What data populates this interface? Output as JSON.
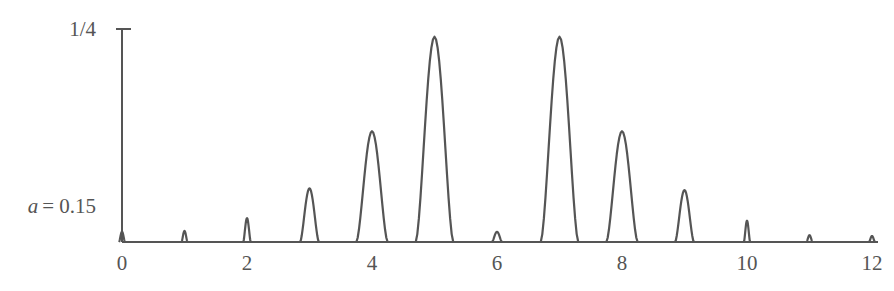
{
  "chart_data": {
    "type": "line",
    "title": "",
    "xlabel": "",
    "ylabel": "",
    "annotation": "a = 0.15",
    "annotation_var": "a",
    "annotation_rest": "= 0.15",
    "y_top_label": "1/4",
    "xlim": [
      0,
      12
    ],
    "ylim": [
      0,
      0.25
    ],
    "grid": false,
    "legend": null,
    "x_ticks": [
      0,
      2,
      4,
      6,
      8,
      10,
      12
    ],
    "x_tick_labels": [
      "0",
      "2",
      "4",
      "6",
      "8",
      "10",
      "12"
    ],
    "y_ticks": [
      0.25
    ],
    "y_tick_labels": [
      "1/4"
    ],
    "series": [
      {
        "name": "peaks",
        "style": "narrow peaks at integer positions",
        "x": [
          0,
          1,
          2,
          3,
          4,
          5,
          6,
          7,
          8,
          9,
          10,
          11,
          12
        ],
        "values": [
          0.012,
          0.013,
          0.028,
          0.063,
          0.13,
          0.241,
          0.012,
          0.241,
          0.13,
          0.061,
          0.025,
          0.008,
          0.007
        ],
        "half_widths": [
          0.04,
          0.04,
          0.06,
          0.15,
          0.25,
          0.3,
          0.08,
          0.3,
          0.25,
          0.15,
          0.05,
          0.04,
          0.04
        ]
      }
    ]
  },
  "colors": {
    "ink": "#555555",
    "background": "#ffffff"
  }
}
